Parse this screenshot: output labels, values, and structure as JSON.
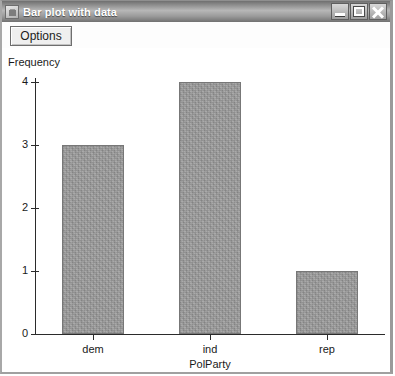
{
  "window": {
    "title": "Bar plot with data",
    "icon": "app-window-icon",
    "controls": {
      "minimize": "Minimize",
      "maximize": "Maximize",
      "close": "Close"
    }
  },
  "toolbar": {
    "options_label": "Options"
  },
  "chart_data": {
    "type": "bar",
    "title": "",
    "categories": [
      "dem",
      "ind",
      "rep"
    ],
    "values": [
      3,
      4,
      1
    ],
    "xlabel": "PolParty",
    "ylabel": "Frequency",
    "ylim": [
      0,
      4
    ],
    "yticks": [
      "0",
      "1",
      "2",
      "3",
      "4"
    ],
    "grid": false,
    "legend": "none",
    "bar_color": "#9b9b9b",
    "axis_color": "#2b2b2b"
  }
}
